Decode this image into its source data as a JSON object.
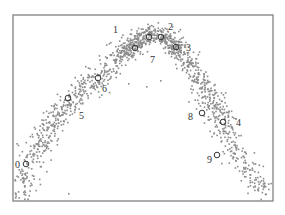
{
  "chart_data": {
    "type": "scatter",
    "title": "",
    "xlabel": "",
    "ylabel": "",
    "grid": false,
    "legend": null,
    "axis_ticks": "none",
    "frame": {
      "left": 13,
      "top": 15,
      "right": 273,
      "bottom": 201
    },
    "point_color": "#8c8c8c",
    "marker_color": "#333333",
    "curve_points_px": [
      [
        18,
        200
      ],
      [
        26,
        164
      ],
      [
        45,
        135
      ],
      [
        68,
        98
      ],
      [
        98,
        78
      ],
      [
        120,
        55
      ],
      [
        135,
        42
      ],
      [
        150,
        32
      ],
      [
        162,
        36
      ],
      [
        180,
        52
      ],
      [
        200,
        80
      ],
      [
        215,
        110
      ],
      [
        223,
        125
      ],
      [
        235,
        150
      ],
      [
        255,
        180
      ],
      [
        268,
        190
      ]
    ],
    "markers": [
      {
        "id": "0",
        "x": 26,
        "y": 164,
        "label_x": 15,
        "label_y": 168
      },
      {
        "id": "1",
        "x": 149,
        "y": 37,
        "label_x": 113,
        "label_y": 33
      },
      {
        "id": "2",
        "x": 161,
        "y": 37,
        "label_x": 168,
        "label_y": 30
      },
      {
        "id": "3",
        "x": 176,
        "y": 47,
        "label_x": 186,
        "label_y": 51
      },
      {
        "id": "4",
        "x": 223,
        "y": 122,
        "label_x": 236,
        "label_y": 126
      },
      {
        "id": "5",
        "x": 68,
        "y": 98,
        "label_x": 79,
        "label_y": 119
      },
      {
        "id": "6",
        "x": 98,
        "y": 78,
        "label_x": 102,
        "label_y": 92
      },
      {
        "id": "7",
        "x": 135,
        "y": 48,
        "label_x": 150,
        "label_y": 63
      },
      {
        "id": "8",
        "x": 202,
        "y": 113,
        "label_x": 188,
        "label_y": 120
      },
      {
        "id": "9",
        "x": 217,
        "y": 155,
        "label_x": 207,
        "label_y": 163
      }
    ],
    "point_count": 1400
  }
}
